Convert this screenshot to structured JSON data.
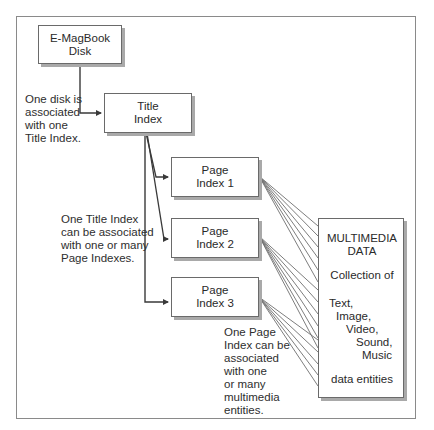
{
  "boxes": {
    "disk": {
      "line1": "E-MagBook",
      "line2": "Disk"
    },
    "title_index": {
      "line1": "Title",
      "line2": "Index"
    },
    "page_index_1": {
      "line1": "Page",
      "line2": "Index 1"
    },
    "page_index_2": {
      "line1": "Page",
      "line2": "Index 2"
    },
    "page_index_3": {
      "line1": "Page",
      "line2": "Index 3"
    }
  },
  "multimedia": {
    "title_line1": "MULTIMEDIA",
    "title_line2": "DATA",
    "collection": "Collection of",
    "types": [
      "Text,",
      "Image,",
      "Video,",
      "Sound,",
      "Music"
    ],
    "footer": "data entities"
  },
  "notes": {
    "disk_to_title": [
      "One disk is",
      "associated",
      "with one",
      "Title Index."
    ],
    "title_to_pages": [
      "One Title Index",
      "can be associated",
      "with one or many",
      "Page Indexes."
    ],
    "page_to_media": [
      "One Page",
      "Index can be",
      "associated",
      "with one",
      "or many",
      "multimedia",
      "entities."
    ]
  },
  "colors": {
    "line": "#3a3a3a",
    "thin_line": "#6e6e6e",
    "shadow": "#a9a9a9",
    "frame": "#8a8a8a"
  }
}
